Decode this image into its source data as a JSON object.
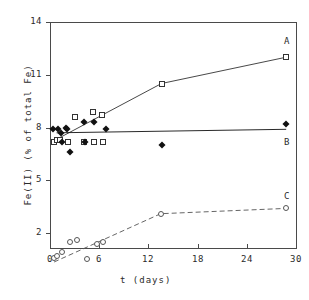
{
  "chart_data": {
    "type": "scatter",
    "title": "",
    "xlabel": "t  (days)",
    "ylabel": "Fe(II)  (% of total Fe)",
    "xlim": [
      0,
      30
    ],
    "ylim": [
      0.15,
      14
    ],
    "xticks": [
      0,
      6,
      12,
      18,
      24,
      30
    ],
    "yticks": [
      2,
      5,
      8,
      11,
      14
    ],
    "xtick_labels": [
      "0",
      "6",
      "12",
      "18",
      "24",
      "30"
    ],
    "ytick_labels": [
      "2",
      "5",
      "8",
      "11",
      "14"
    ],
    "grid": false,
    "legend_position": "right-inline",
    "series": [
      {
        "name": "A",
        "label": "A",
        "marker": "open-square",
        "line": "solid",
        "color": "#333333",
        "label_x": 28.9,
        "label_y": 12.9,
        "points": [
          {
            "x": 0.5,
            "y": 7.2
          },
          {
            "x": 0.9,
            "y": 7.3
          },
          {
            "x": 1.2,
            "y": 7.3
          },
          {
            "x": 2.2,
            "y": 7.2
          },
          {
            "x": 3.1,
            "y": 8.6
          },
          {
            "x": 4.1,
            "y": 7.2
          },
          {
            "x": 5.2,
            "y": 8.9
          },
          {
            "x": 5.4,
            "y": 7.2
          },
          {
            "x": 6.3,
            "y": 8.7
          },
          {
            "x": 6.5,
            "y": 7.2
          },
          {
            "x": 13.6,
            "y": 10.5
          },
          {
            "x": 28.8,
            "y": 12.0
          }
        ],
        "line_points": [
          {
            "x": 0.7,
            "y": 7.3
          },
          {
            "x": 13.6,
            "y": 10.5
          },
          {
            "x": 28.8,
            "y": 12.0
          }
        ]
      },
      {
        "name": "B",
        "label": "B",
        "marker": "filled-diamond",
        "line": "solid",
        "color": "#111111",
        "label_x": 28.9,
        "label_y": 7.2,
        "points": [
          {
            "x": 0.4,
            "y": 7.9
          },
          {
            "x": 1.0,
            "y": 7.9
          },
          {
            "x": 1.3,
            "y": 7.7
          },
          {
            "x": 1.5,
            "y": 7.2
          },
          {
            "x": 2.0,
            "y": 8.0
          },
          {
            "x": 2.1,
            "y": 7.9
          },
          {
            "x": 2.4,
            "y": 6.6
          },
          {
            "x": 4.1,
            "y": 8.3
          },
          {
            "x": 4.3,
            "y": 7.2
          },
          {
            "x": 5.3,
            "y": 8.3
          },
          {
            "x": 6.8,
            "y": 7.9
          },
          {
            "x": 13.6,
            "y": 7.0
          },
          {
            "x": 28.8,
            "y": 8.2
          }
        ],
        "line_points": [
          {
            "x": 0.8,
            "y": 7.7
          },
          {
            "x": 28.8,
            "y": 7.9
          }
        ]
      },
      {
        "name": "C",
        "label": "C",
        "marker": "open-circle",
        "line": "dashed",
        "color": "#555555",
        "label_x": 28.9,
        "label_y": 4.1,
        "points": [
          {
            "x": 0.5,
            "y": 0.6
          },
          {
            "x": 0.9,
            "y": 0.7
          },
          {
            "x": 1.4,
            "y": 0.9
          },
          {
            "x": 2.4,
            "y": 1.5
          },
          {
            "x": 3.3,
            "y": 1.6
          },
          {
            "x": 4.5,
            "y": 0.5
          },
          {
            "x": 5.7,
            "y": 1.4
          },
          {
            "x": 6.5,
            "y": 1.5
          },
          {
            "x": 13.5,
            "y": 3.1
          },
          {
            "x": 28.8,
            "y": 3.4
          }
        ],
        "line_points": [
          {
            "x": 0.5,
            "y": 0.35
          },
          {
            "x": 13.5,
            "y": 3.1
          },
          {
            "x": 28.8,
            "y": 3.4
          }
        ]
      }
    ]
  }
}
